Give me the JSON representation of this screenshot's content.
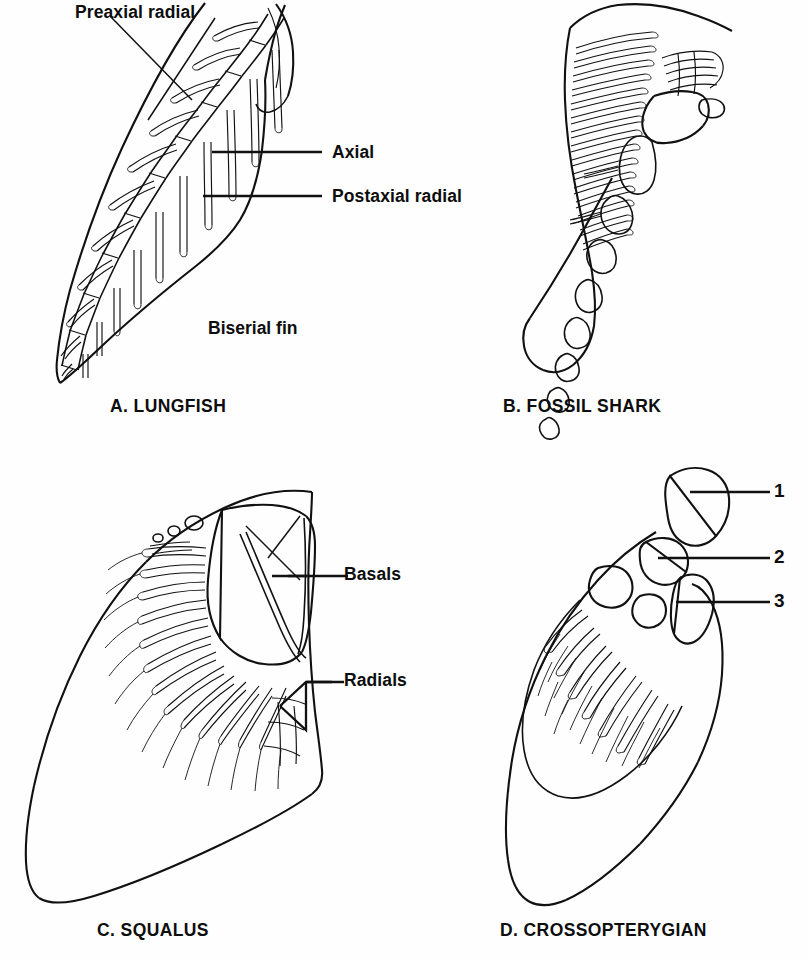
{
  "figure": {
    "background_color": "#fefefe",
    "ink_color": "#111111",
    "width": 809,
    "height": 960
  },
  "panels": [
    {
      "id": "A",
      "caption": "A. LUNGFISH",
      "labels": [
        {
          "id": "preaxial-radial",
          "text": "Preaxial radial"
        },
        {
          "id": "axial",
          "text": "Axial"
        },
        {
          "id": "postaxial-radial",
          "text": "Postaxial radial"
        },
        {
          "id": "biserial-fin",
          "text": "Biserial fin"
        }
      ]
    },
    {
      "id": "B",
      "caption": "B. FOSSIL SHARK",
      "labels": []
    },
    {
      "id": "C",
      "caption": "C. SQUALUS",
      "labels": [
        {
          "id": "basals",
          "text": "Basals"
        },
        {
          "id": "radials",
          "text": "Radials"
        }
      ]
    },
    {
      "id": "D",
      "caption": "D. CROSSOPTERYGIAN",
      "labels": [
        {
          "id": "callout-1",
          "text": "1"
        },
        {
          "id": "callout-2",
          "text": "2"
        },
        {
          "id": "callout-3",
          "text": "3"
        }
      ]
    }
  ]
}
